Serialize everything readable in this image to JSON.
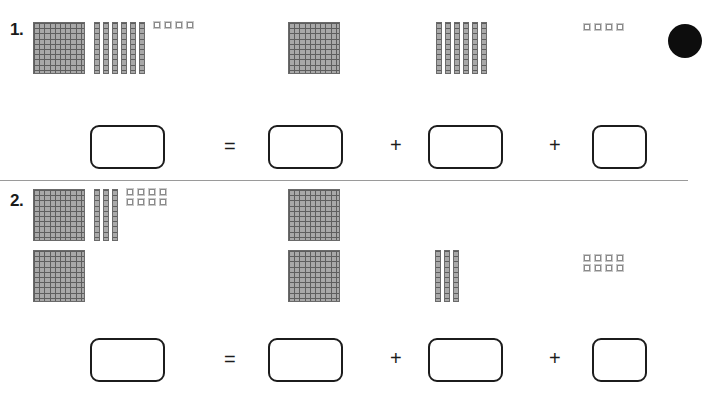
{
  "worksheet": {
    "title": "Base-Ten Blocks Place Value Worksheet",
    "divider_color": "#9a9a9a",
    "block_fill_color": "#a8a8a8",
    "block_line_color": "#5e5e5e",
    "box_border_color": "#1c1c1c"
  },
  "problems": [
    {
      "number": "1.",
      "total_value": 164,
      "left_group": {
        "hundreds": 1,
        "tens": 6,
        "ones": 4,
        "flats_label": "hundreds-flat",
        "rods_label": "tens-rod",
        "units_label": "ones-unit"
      },
      "expanded": {
        "hundreds": 1,
        "tens": 6,
        "ones": 4
      },
      "equation": {
        "equals": "=",
        "plus_1": "+",
        "plus_2": "+",
        "answer_total": "",
        "answer_hundreds": "",
        "answer_tens": "",
        "answer_ones": ""
      }
    },
    {
      "number": "2.",
      "total_value": 238,
      "left_group": {
        "hundreds": 2,
        "tens": 3,
        "ones": 8,
        "flats_label": "hundreds-flat",
        "rods_label": "tens-rod",
        "units_label": "ones-unit"
      },
      "expanded": {
        "hundreds": 2,
        "tens": 3,
        "ones": 8
      },
      "equation": {
        "equals": "=",
        "plus_1": "+",
        "plus_2": "+",
        "answer_total": "",
        "answer_hundreds": "",
        "answer_tens": "",
        "answer_ones": ""
      }
    }
  ]
}
